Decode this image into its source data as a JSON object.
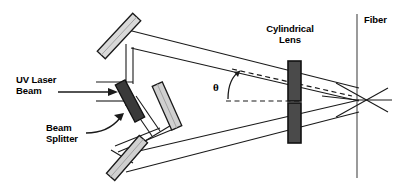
{
  "figure": {
    "type": "optical-setup-diagram",
    "title_visible": false,
    "background": "#ffffff",
    "line_color": "#1a1a1a",
    "width": 418,
    "height": 191
  },
  "labels": {
    "uv_laser_beam": "UV Laser\nBeam",
    "beam_splitter": "Beam\nSplitter",
    "cylindrical_lens": "Cylindrical\nLens",
    "fiber": "Fiber",
    "theta": "θ"
  },
  "components": [
    {
      "id": "top-mirror",
      "name": "Top Mirror",
      "kind": "mirror",
      "fill": "#d9d9d9",
      "stroke": "#1a1a1a",
      "cx": 119,
      "cy": 36,
      "length": 52,
      "thickness": 11,
      "angle": -47
    },
    {
      "id": "beam-splitter",
      "name": "Beam Splitter",
      "kind": "beam-splitter",
      "fill": "#3a3a3a",
      "stroke": "#111111",
      "cx": 130,
      "cy": 101,
      "length": 42,
      "thickness": 11,
      "angle": 62
    },
    {
      "id": "right-mirror",
      "name": "Right Mirror",
      "kind": "mirror",
      "fill": "#d0d0d0",
      "stroke": "#1a1a1a",
      "cx": 167,
      "cy": 106,
      "length": 48,
      "thickness": 11,
      "angle": 66
    },
    {
      "id": "bottom-mirror",
      "name": "Bottom Mirror",
      "kind": "mirror",
      "fill": "#d0d0d0",
      "stroke": "#1a1a1a",
      "cx": 127,
      "cy": 158,
      "length": 50,
      "thickness": 11,
      "angle": -49
    },
    {
      "id": "cyl-lens-upper",
      "name": "Cylindrical Lens Upper Segment",
      "kind": "lens",
      "fill": "#4a4a4a",
      "stroke": "#111111",
      "x": 288,
      "y": 61,
      "w": 13,
      "h": 40
    },
    {
      "id": "cyl-lens-lower",
      "name": "Cylindrical Lens Lower Segment",
      "kind": "lens",
      "fill": "#4a4a4a",
      "stroke": "#111111",
      "x": 288,
      "y": 103,
      "w": 13,
      "h": 40
    },
    {
      "id": "fiber",
      "name": "Fiber",
      "kind": "fiber",
      "stroke": "#6a6a6a",
      "x": 357,
      "y1": 14,
      "y2": 178
    }
  ],
  "label_positions": {
    "uv_laser_beam": {
      "left": 16,
      "top": 75
    },
    "beam_splitter": {
      "left": 46,
      "top": 123
    },
    "cylindrical_lens": {
      "left": 258,
      "top": 24
    },
    "fiber": {
      "left": 364,
      "top": 15
    },
    "theta": {
      "left": 214,
      "top": 75
    }
  },
  "annotations": {
    "input_arrow": {
      "x1": 76,
      "y1": 92,
      "x2": 120,
      "y2": 92
    },
    "beam_splitter_pointer": "curved arrow from label to beam splitter",
    "theta_marker": "curved arrow between dashed horizontal reference and dashed beam axis",
    "convergence_point": {
      "x": 357,
      "y": 100
    }
  },
  "beam_paths": {
    "upper_pair": [
      [
        [
          128,
          25
        ],
        [
          357,
          89
        ]
      ],
      [
        [
          131,
          45
        ],
        [
          357,
          100
        ]
      ]
    ],
    "lower_pair": [
      [
        [
          140,
          150
        ],
        [
          357,
          100
        ]
      ],
      [
        [
          128,
          172
        ],
        [
          357,
          111
        ]
      ]
    ],
    "dashed_axis": [
      [
        232,
        70
      ],
      [
        352,
        96
      ]
    ],
    "dashed_reference": [
      [
        228,
        101
      ],
      [
        300,
        101
      ]
    ]
  }
}
